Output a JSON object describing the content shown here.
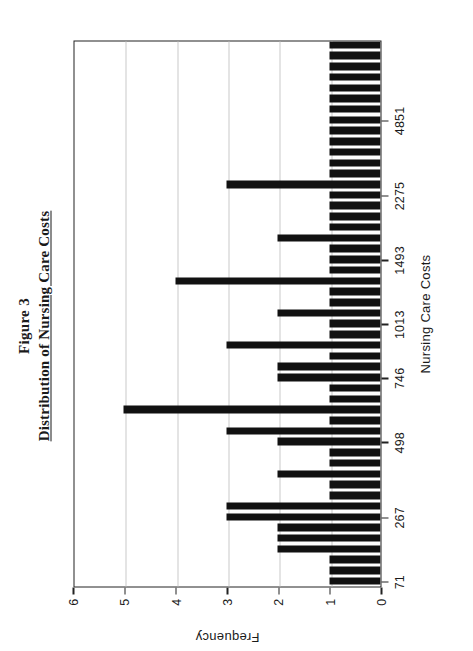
{
  "figure": {
    "number_label": "Figure 3",
    "caption": "Distribution of Nursing Care Costs"
  },
  "chart_data": {
    "type": "bar",
    "title": "Distribution of Nursing Care Costs",
    "subtitle": "Figure 3",
    "xlabel": "Nursing Care Costs",
    "ylabel": "Frequency",
    "orientation": "vertical-histogram-printed-sideways",
    "grid": true,
    "legend": null,
    "ylim": [
      0,
      6
    ],
    "ytick_labels": [
      "0",
      "1",
      "2",
      "3",
      "4",
      "5",
      "6"
    ],
    "ytick_values": [
      0,
      1,
      2,
      3,
      4,
      5,
      6
    ],
    "xtick_labels": [
      "71",
      "267",
      "498",
      "746",
      "1013",
      "1493",
      "2275",
      "4851"
    ],
    "xtick_bin_index": [
      0,
      6,
      13,
      19,
      24,
      30,
      36,
      43
    ],
    "bin_count": 51,
    "values": [
      1,
      1,
      1,
      2,
      2,
      2,
      3,
      3,
      1,
      1,
      2,
      1,
      1,
      2,
      3,
      1,
      5,
      1,
      1,
      2,
      2,
      1,
      3,
      1,
      1,
      2,
      1,
      1,
      4,
      1,
      1,
      1,
      2,
      1,
      1,
      1,
      1,
      3,
      1,
      1,
      1,
      1,
      1,
      1,
      1,
      1,
      1,
      1,
      1,
      1,
      1
    ]
  },
  "colors": {
    "bar": "#111111",
    "axis": "#222222",
    "grid": "#c9c9c9",
    "background": "#ffffff",
    "text": "#1a1a1a"
  }
}
